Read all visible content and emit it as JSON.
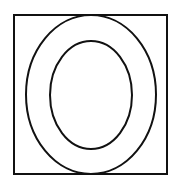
{
  "diagram": {
    "stroke_color": "#111111",
    "background_color": "#ffffff",
    "square": {
      "x": 14,
      "y": 15,
      "width": 153,
      "height": 159
    },
    "outer_ellipse": {
      "cx": 91,
      "cy": 94.5,
      "rx": 65,
      "ry": 79.5
    },
    "inner_ellipse": {
      "cx": 91,
      "cy": 95,
      "rx": 41,
      "ry": 54
    }
  }
}
